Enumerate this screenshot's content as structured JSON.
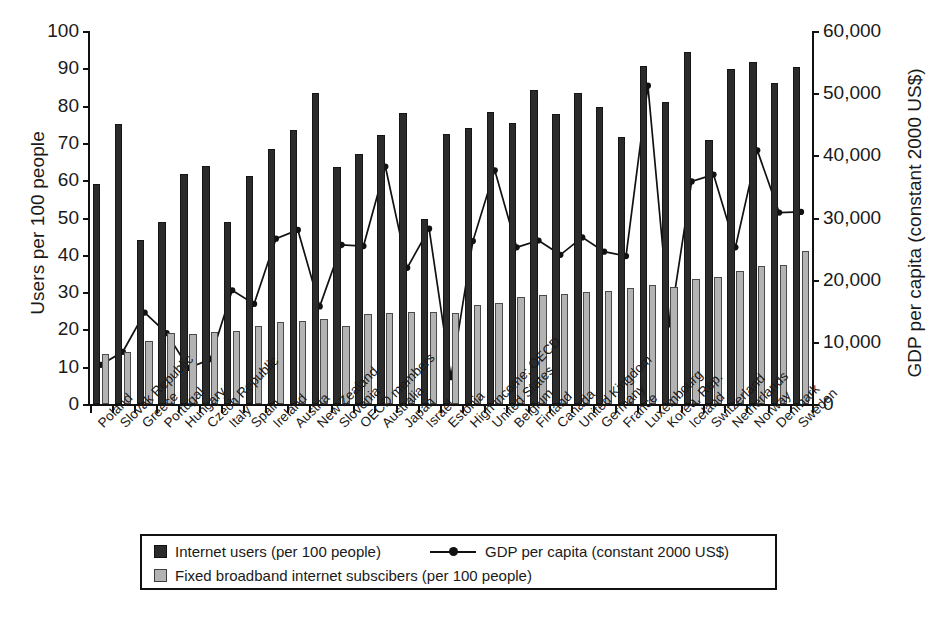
{
  "chart_data": {
    "type": "bar",
    "title": "",
    "subtitle": "",
    "xlabel": "",
    "ylabel": "Users per 100 people",
    "ylabel_right": "GDP per capita (constant 2000 US$)",
    "ylim": [
      0,
      100
    ],
    "ylim_right": [
      0,
      60000
    ],
    "yticks": [
      0,
      10,
      20,
      30,
      40,
      50,
      60,
      70,
      80,
      90,
      100
    ],
    "yticks_right": [
      0,
      10000,
      20000,
      30000,
      40000,
      50000,
      60000
    ],
    "ytick_labels_right": [
      "0",
      "10,000",
      "20,000",
      "30,000",
      "40,000",
      "50,000",
      "60,000"
    ],
    "grid": false,
    "legend_position": "bottom",
    "categories": [
      "Poland",
      "Slovak Republic",
      "Greece",
      "Portugal",
      "Hungary",
      "Czech Republic",
      "Italy",
      "Spain",
      "Ireland",
      "Austria",
      "New Zealand",
      "Slovenia",
      "OECD members",
      "Australia",
      "Japan",
      "Israel",
      "Estonia",
      "High income: OECD",
      "United States",
      "Belgium",
      "Finland",
      "Canada",
      "United Kingdom",
      "Germany",
      "France",
      "Luxembourg",
      "Korea, Rep.",
      "Iceland",
      "Switzerland",
      "Netherlands",
      "Norway",
      "Denmark",
      "Sweden"
    ],
    "series": [
      {
        "name": "Internet users (per 100 people)",
        "axis": "left",
        "render": "bar",
        "color": "#2b2b2b",
        "values": [
          59.0,
          75.0,
          44.0,
          48.7,
          61.6,
          63.7,
          48.7,
          61.2,
          68.5,
          73.5,
          83.5,
          63.6,
          67.0,
          72.2,
          78.0,
          49.5,
          72.5,
          74.0,
          78.3,
          75.3,
          84.2,
          77.7,
          83.4,
          79.7,
          71.6,
          90.6,
          81.0,
          94.5,
          70.9,
          89.8,
          91.8,
          86.0,
          90.3
        ]
      },
      {
        "name": "Fixed broadband internet subscibers (per 100 people)",
        "axis": "left",
        "render": "bar",
        "color": "#b3b3b3",
        "values": [
          13.3,
          14.0,
          17.0,
          19.0,
          18.7,
          19.3,
          19.5,
          21.0,
          22.0,
          22.3,
          22.7,
          21.0,
          24.0,
          24.5,
          24.8,
          24.8,
          24.5,
          26.6,
          27.2,
          28.8,
          29.2,
          29.4,
          30.0,
          30.4,
          31.0,
          31.8,
          31.5,
          33.5,
          34.0,
          35.6,
          37.0,
          37.3,
          40.9
        ]
      },
      {
        "name": "GDP per capita (constant 2000 US$)",
        "axis": "right",
        "render": "line",
        "color": "#111111",
        "marker": "circle",
        "values": [
          6300,
          8400,
          14700,
          11400,
          5800,
          7200,
          18300,
          16100,
          26600,
          28000,
          15700,
          25600,
          25400,
          38200,
          21900,
          28200,
          4300,
          26200,
          37600,
          25200,
          26300,
          24000,
          26800,
          24500,
          23800,
          51200,
          12800,
          35800,
          36900,
          25200,
          40800,
          30800,
          30900
        ]
      }
    ],
    "legend": [
      {
        "id": "internet-users",
        "label": "Internet users (per 100 people)",
        "swatch": "dark-square"
      },
      {
        "id": "fixed-broadband",
        "label": "Fixed broadband internet subscibers (per 100 people)",
        "swatch": "light-square"
      },
      {
        "id": "gdp-per-capita",
        "label": "GDP per capita (constant 2000 US$)",
        "swatch": "line-marker"
      }
    ]
  }
}
